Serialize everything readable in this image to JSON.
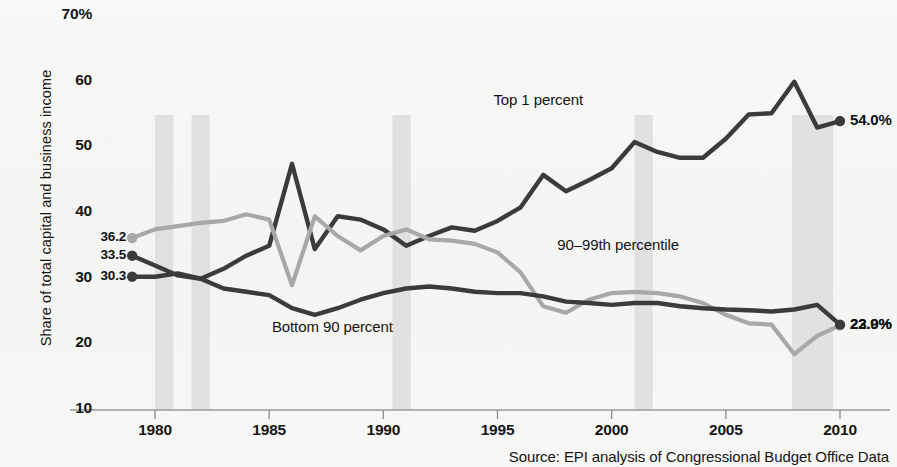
{
  "chart_data": {
    "type": "line",
    "title": "",
    "subtitle": "",
    "xlabel": "",
    "ylabel": "Share of total capital and business income",
    "xlim": [
      1979,
      2010
    ],
    "ylim": [
      10,
      70
    ],
    "grid": false,
    "legend": "inline-annotations",
    "ytick_labels": [
      "70%",
      "60",
      "50",
      "40",
      "30",
      "20",
      "10"
    ],
    "ytick_values": [
      70,
      60,
      50,
      40,
      30,
      20,
      10
    ],
    "xtick_labels": [
      "1980",
      "1985",
      "1990",
      "1995",
      "2000",
      "2005",
      "2010"
    ],
    "xtick_values": [
      1980,
      1985,
      1990,
      1995,
      2000,
      2005,
      2010
    ],
    "x": [
      1979,
      1980,
      1981,
      1982,
      1983,
      1984,
      1985,
      1986,
      1987,
      1988,
      1989,
      1990,
      1991,
      1992,
      1993,
      1994,
      1995,
      1996,
      1997,
      1998,
      1999,
      2000,
      2001,
      2002,
      2003,
      2004,
      2005,
      2006,
      2007,
      2008,
      2009,
      2010
    ],
    "series": [
      {
        "name": "Top 1 percent",
        "color": "#3b3b3b",
        "start_label": "33.5",
        "end_label": "54.0%",
        "values": [
          33.5,
          32.0,
          30.5,
          30.0,
          31.5,
          33.5,
          35.0,
          47.5,
          34.5,
          39.5,
          39.0,
          37.5,
          35.0,
          36.5,
          37.8,
          37.3,
          38.8,
          40.8,
          45.8,
          43.3,
          45.0,
          46.8,
          50.8,
          49.3,
          48.4,
          48.4,
          51.3,
          55.0,
          55.2,
          60.0,
          53.0,
          54.0
        ]
      },
      {
        "name": "90–99th percentile",
        "color": "#a8a8a8",
        "start_label": "36.2",
        "end_label": "22.9%",
        "values": [
          36.2,
          37.5,
          38.0,
          38.5,
          38.8,
          39.8,
          39.0,
          29.0,
          39.5,
          36.5,
          34.3,
          36.5,
          37.5,
          36.0,
          35.8,
          35.3,
          34.0,
          31.0,
          25.8,
          24.8,
          26.8,
          27.8,
          28.0,
          27.8,
          27.3,
          26.3,
          24.5,
          23.2,
          23.0,
          18.5,
          21.3,
          22.9
        ]
      },
      {
        "name": "Bottom 90 percent",
        "color": "#3b3b3b",
        "start_label": "30.3",
        "end_label": "23.0%",
        "values": [
          30.3,
          30.3,
          30.8,
          30.0,
          28.5,
          28.0,
          27.5,
          25.5,
          24.5,
          25.5,
          26.8,
          27.8,
          28.5,
          28.8,
          28.5,
          28.0,
          27.8,
          27.8,
          27.3,
          26.5,
          26.3,
          26.0,
          26.3,
          26.3,
          25.8,
          25.5,
          25.3,
          25.2,
          25.0,
          25.3,
          26.0,
          23.0
        ]
      }
    ],
    "recession_bands": [
      {
        "start": 1980.0,
        "end": 1980.8
      },
      {
        "start": 1981.6,
        "end": 1982.4
      },
      {
        "start": 1990.4,
        "end": 1991.2
      },
      {
        "start": 2001.0,
        "end": 2001.8
      },
      {
        "start": 2007.9,
        "end": 2009.7
      }
    ],
    "annotations": [
      {
        "text": "Top 1 percent",
        "x": 1999.2,
        "y": 57.0
      },
      {
        "text": "90–99th percentile",
        "x": 2002.0,
        "y": 35.0
      },
      {
        "text": "Bottom 90 percent",
        "x": 1989.5,
        "y": 22.5
      }
    ],
    "source": "Source: EPI  analysis of Congressional Budget Office Data"
  }
}
